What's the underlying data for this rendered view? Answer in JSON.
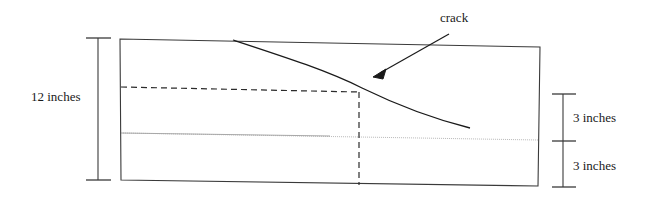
{
  "diagram": {
    "labels": {
      "overall_depth": "12 inches",
      "upper_segment": "3 inches",
      "lower_segment": "3 inches",
      "crack": "crack"
    },
    "colors": {
      "outline": "#3a3a3a",
      "crack_line": "#1a1a1a",
      "dashed_line": "#2b2b2b",
      "centerline": "#b8b8b8",
      "dimension_line": "#3a3a3a",
      "text": "#1a1a1a",
      "background": "#ffffff"
    },
    "geometry": {
      "beam_outline": "120,39 540,47 538,186 121,180",
      "left_dimension": {
        "x": 98,
        "top": 38,
        "bottom": 180
      },
      "right_dimension": {
        "x": 563,
        "top": 94,
        "middle": 141,
        "bottom": 187
      },
      "dashed_horizontal": {
        "x1": 121,
        "y1": 87,
        "x2": 359,
        "y2": 92
      },
      "dashed_vertical": {
        "x": 359,
        "y1": 92,
        "y2": 185
      },
      "centerline": {
        "x1": 121,
        "y1": 133,
        "x2": 538,
        "y2": 140
      },
      "crack_path": "M233,40 C290,60 330,72 362,88 C400,106 440,120 470,128",
      "arrow": {
        "tail_x": 449,
        "tail_y": 34,
        "head_x": 374,
        "head_y": 77
      }
    }
  }
}
